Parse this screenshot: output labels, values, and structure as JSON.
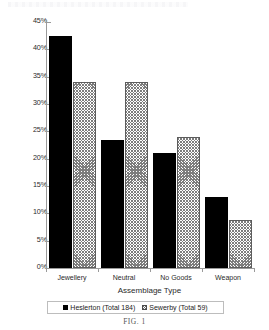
{
  "figure": {
    "caption": "FIG. 1"
  },
  "chart_data": {
    "type": "bar",
    "title": "",
    "xlabel": "Assemblage Type",
    "ylabel": "Proportion of Total Burials",
    "categories": [
      "Jewellery",
      "Neutral",
      "No Goods",
      "Weapon"
    ],
    "series": [
      {
        "name": "Heslerton (Total 184)",
        "swatch": "solid-black",
        "color": "#000000",
        "values": [
          42.5,
          23.5,
          21.0,
          13.0
        ]
      },
      {
        "name": "Sewerby (Total 59)",
        "swatch": "cross-hatch-gray",
        "color": "#7d7d7d",
        "values": [
          34.0,
          34.0,
          24.0,
          8.7
        ]
      }
    ],
    "ylim": [
      0,
      45
    ],
    "ytick_values": [
      0,
      5,
      10,
      15,
      20,
      25,
      30,
      35,
      40,
      45
    ],
    "ytick_labels": [
      "0%",
      "5%",
      "10%",
      "15%",
      "20%",
      "25%",
      "30%",
      "35%",
      "40%",
      "45%"
    ],
    "grid": false,
    "legend_position": "bottom"
  }
}
